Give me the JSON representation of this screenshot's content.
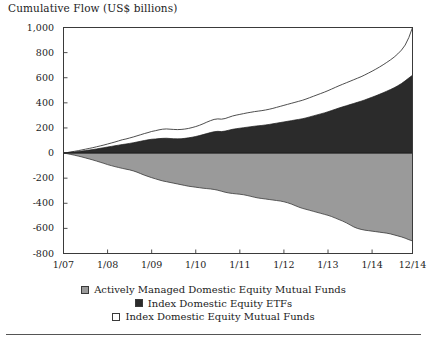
{
  "chart_data": {
    "type": "area",
    "title": "Cumulative Flow (US$ billions)",
    "xlabel": "",
    "ylabel": "",
    "grid": false,
    "legend_position": "bottom-center",
    "stacked": false,
    "ylim": [
      -800,
      1000
    ],
    "ytick_labels": [
      "1,000",
      "800",
      "600",
      "400",
      "200",
      "0",
      "-200",
      "-400",
      "-600",
      "-800"
    ],
    "ytick_values": [
      1000,
      800,
      600,
      400,
      200,
      0,
      -200,
      -400,
      -600,
      -800
    ],
    "xtick_labels": [
      "1/07",
      "1/08",
      "1/09",
      "1/10",
      "1/11",
      "1/12",
      "1/13",
      "1/14",
      "12/14"
    ],
    "xtick_values": [
      0,
      12,
      24,
      36,
      48,
      60,
      72,
      84,
      95
    ],
    "x": [
      0,
      1,
      2,
      3,
      4,
      5,
      6,
      7,
      8,
      9,
      10,
      11,
      12,
      13,
      14,
      15,
      16,
      17,
      18,
      19,
      20,
      21,
      22,
      23,
      24,
      25,
      26,
      27,
      28,
      29,
      30,
      31,
      32,
      33,
      34,
      35,
      36,
      37,
      38,
      39,
      40,
      41,
      42,
      43,
      44,
      45,
      46,
      47,
      48,
      49,
      50,
      51,
      52,
      53,
      54,
      55,
      56,
      57,
      58,
      59,
      60,
      61,
      62,
      63,
      64,
      65,
      66,
      67,
      68,
      69,
      70,
      71,
      72,
      73,
      74,
      75,
      76,
      77,
      78,
      79,
      80,
      81,
      82,
      83,
      84,
      85,
      86,
      87,
      88,
      89,
      90,
      91,
      92,
      93,
      94,
      95
    ],
    "series": [
      {
        "name": "Index Domestic Equity Mutual Funds",
        "color": "#ffffff",
        "edge_color": "#3a3a3a",
        "note": "Upper boundary line; total of index mutual funds plus index ETFs cumulative flow",
        "values": [
          0,
          4,
          9,
          14,
          19,
          25,
          31,
          37,
          43,
          50,
          57,
          64,
          72,
          80,
          88,
          97,
          106,
          112,
          120,
          128,
          137,
          146,
          155,
          163,
          172,
          178,
          185,
          190,
          192,
          190,
          188,
          187,
          188,
          191,
          196,
          203,
          211,
          221,
          233,
          246,
          258,
          268,
          272,
          270,
          275,
          285,
          295,
          302,
          308,
          314,
          320,
          325,
          330,
          334,
          338,
          343,
          349,
          356,
          364,
          372,
          380,
          388,
          396,
          404,
          412,
          420,
          430,
          441,
          452,
          463,
          474,
          485,
          497,
          510,
          523,
          536,
          548,
          560,
          572,
          584,
          596,
          608,
          622,
          637,
          652,
          668,
          685,
          703,
          722,
          742,
          764,
          790,
          820,
          860,
          920,
          1000
        ]
      },
      {
        "name": "Index Domestic Equity ETFs",
        "color": "#2b2b2b",
        "edge_color": "#1a1a1a",
        "note": "Dark filled area measured from zero upward",
        "values": [
          0,
          3,
          6,
          9,
          12,
          16,
          20,
          24,
          28,
          33,
          38,
          43,
          48,
          53,
          58,
          63,
          68,
          72,
          77,
          82,
          88,
          94,
          100,
          105,
          110,
          112,
          115,
          117,
          118,
          116,
          114,
          113,
          114,
          117,
          121,
          126,
          132,
          139,
          147,
          155,
          163,
          170,
          173,
          171,
          175,
          182,
          189,
          194,
          198,
          202,
          206,
          210,
          214,
          217,
          220,
          224,
          228,
          233,
          238,
          243,
          248,
          253,
          258,
          263,
          268,
          273,
          280,
          288,
          296,
          304,
          312,
          320,
          329,
          339,
          349,
          359,
          368,
          377,
          386,
          395,
          404,
          413,
          423,
          434,
          445,
          456,
          468,
          480,
          493,
          506,
          520,
          536,
          554,
          575,
          598,
          620
        ]
      },
      {
        "name": "Actively Managed Domestic Equity Mutual Funds",
        "color": "#9a9a9a",
        "edge_color": "#3a3a3a",
        "note": "Gray filled area measured from zero downward (negative cumulative outflow)",
        "values": [
          0,
          -5,
          -11,
          -17,
          -24,
          -31,
          -39,
          -47,
          -55,
          -64,
          -73,
          -82,
          -92,
          -100,
          -108,
          -115,
          -122,
          -128,
          -134,
          -142,
          -152,
          -164,
          -176,
          -186,
          -196,
          -205,
          -214,
          -222,
          -228,
          -234,
          -240,
          -246,
          -252,
          -258,
          -264,
          -268,
          -272,
          -276,
          -280,
          -283,
          -286,
          -290,
          -296,
          -304,
          -312,
          -318,
          -322,
          -325,
          -328,
          -332,
          -338,
          -345,
          -352,
          -358,
          -362,
          -366,
          -370,
          -374,
          -378,
          -382,
          -388,
          -396,
          -406,
          -418,
          -430,
          -440,
          -448,
          -456,
          -464,
          -472,
          -480,
          -488,
          -496,
          -506,
          -518,
          -530,
          -542,
          -556,
          -572,
          -588,
          -600,
          -608,
          -614,
          -618,
          -622,
          -626,
          -630,
          -634,
          -638,
          -644,
          -652,
          -660,
          -668,
          -678,
          -690,
          -700
        ]
      }
    ]
  },
  "legend": {
    "items": [
      {
        "label": "Actively Managed Domestic Equity Mutual Funds",
        "swatch": "#9a9a9a"
      },
      {
        "label": "Index Domestic Equity ETFs",
        "swatch": "#2b2b2b"
      },
      {
        "label": "Index Domestic Equity Mutual Funds",
        "swatch": "#ffffff"
      }
    ]
  }
}
